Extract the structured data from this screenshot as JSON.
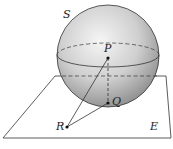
{
  "diagram": {
    "labels": {
      "sphere": "S",
      "plane": "E",
      "point_p": "P",
      "point_q": "Q",
      "point_r": "R"
    },
    "colors": {
      "line": "#333333",
      "sphere_light": "#f2f2f2",
      "sphere_dark": "#8c8c8c"
    }
  }
}
